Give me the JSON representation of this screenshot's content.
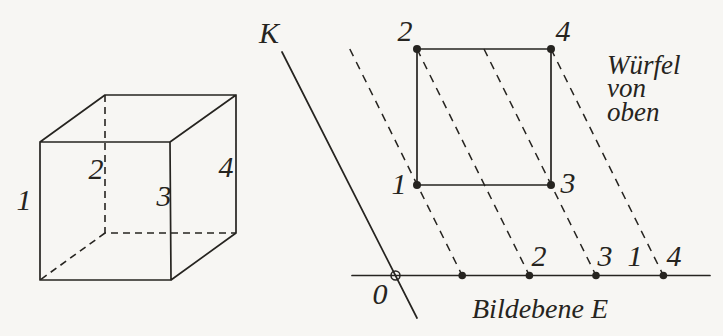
{
  "colors": {
    "ink": "#262420",
    "paper": "#f7f6f3"
  },
  "cube_view": {
    "edge_labels": {
      "edge1": "1",
      "edge2": "2",
      "edge3": "3",
      "edge4": "4"
    }
  },
  "top_view": {
    "direction_line_label": "K",
    "origin_label": "0",
    "square_corner_labels": {
      "bottom_left": "1",
      "top_left": "2",
      "bottom_right": "3",
      "top_right": "4"
    },
    "image_line_labels": {
      "point2": "2",
      "point3": "3",
      "point1": "1",
      "point4": "4"
    },
    "caption": {
      "line1": "Würfel",
      "line2": "von",
      "line3": "oben"
    },
    "image_plane_label": "Bildebene E"
  }
}
